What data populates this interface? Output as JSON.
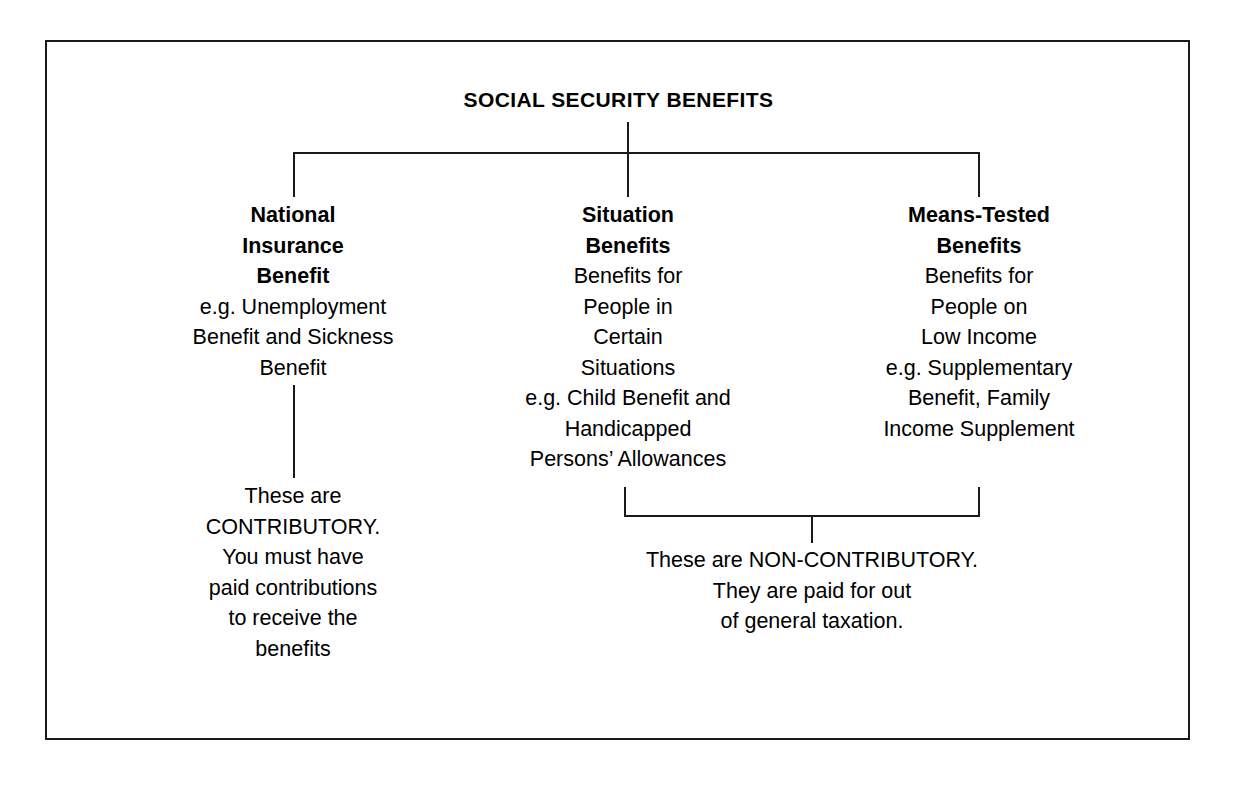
{
  "diagram": {
    "title": "SOCIAL SECURITY BENEFITS",
    "frame_color": "#1a1a1a",
    "connector_color": "#1a1a1a",
    "background_color": "#ffffff",
    "columns": [
      {
        "id": "national-insurance-benefit",
        "heading": [
          "National",
          "Insurance",
          "Benefit"
        ],
        "body": [
          "e.g. Unemployment",
          "Benefit and Sickness",
          "Benefit"
        ]
      },
      {
        "id": "situation-benefits",
        "heading": [
          "Situation",
          "Benefits"
        ],
        "body": [
          "Benefits for",
          "People in",
          "Certain",
          "Situations",
          "e.g. Child Benefit and",
          "Handicapped",
          "Persons’ Allowances"
        ]
      },
      {
        "id": "means-tested-benefits",
        "heading": [
          "Means-Tested",
          "Benefits"
        ],
        "body": [
          "Benefits for",
          "People on",
          "Low Income",
          "e.g. Supplementary",
          "Benefit, Family",
          "Income Supplement"
        ]
      }
    ],
    "notes": [
      {
        "id": "contributory-note",
        "lines": [
          "These are",
          "CONTRIBUTORY.",
          "You must have",
          "paid contributions",
          "to receive the",
          "benefits"
        ]
      },
      {
        "id": "non-contributory-note",
        "lines": [
          "These are NON-CONTRIBUTORY.",
          "They are paid for out",
          "of general taxation."
        ]
      }
    ]
  }
}
